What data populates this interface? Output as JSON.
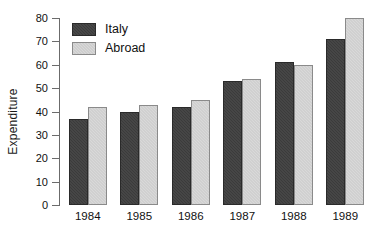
{
  "chart_data": {
    "type": "bar",
    "title": "",
    "subtitle": "",
    "xlabel": "",
    "ylabel": "Expenditure",
    "categories": [
      "1984",
      "1985",
      "1986",
      "1987",
      "1988",
      "1989"
    ],
    "series": [
      {
        "name": "Italy",
        "color": "#3b3b3b",
        "values": [
          37,
          40,
          42,
          53,
          61,
          71
        ]
      },
      {
        "name": "Abroad",
        "color": "#d9d9d9",
        "values": [
          42,
          43,
          45,
          54,
          60,
          80
        ]
      }
    ],
    "ylim": [
      0,
      80
    ],
    "ytick_values": [
      0,
      10,
      20,
      30,
      40,
      50,
      60,
      70,
      80
    ],
    "ytick_labels": [
      "0",
      "10",
      "20",
      "30",
      "40",
      "50",
      "60",
      "70",
      "80"
    ],
    "grid": false,
    "legend_position": "top-left",
    "legend_entries": [
      "Italy",
      "Abroad"
    ]
  },
  "axis": {
    "y_title": "Expenditure",
    "y_ticks": [
      "80",
      "70",
      "60",
      "50",
      "40",
      "30",
      "20",
      "10",
      "0"
    ],
    "x_ticks": [
      "1984",
      "1985",
      "1986",
      "1987",
      "1988",
      "1989"
    ]
  },
  "legend": {
    "italy_label": "Italy",
    "abroad_label": "Abroad"
  },
  "colors": {
    "italy": "#3b3b3b",
    "abroad": "#d9d9d9",
    "axis": "#6b6b6b",
    "text": "#111111",
    "background": "#ffffff"
  }
}
